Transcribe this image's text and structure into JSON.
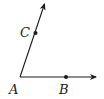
{
  "diagram": {
    "type": "geometry-angle",
    "colors": {
      "stroke": "#1a1a1a",
      "background": "#ffffff"
    },
    "vertex": {
      "label": "A",
      "x": 20,
      "y": 77
    },
    "rays": [
      {
        "id": "ray-AB",
        "from": "A",
        "through": "B",
        "end": {
          "x": 97,
          "y": 77
        }
      },
      {
        "id": "ray-AC",
        "from": "A",
        "through": "C",
        "end": {
          "x": 45,
          "y": 3
        }
      }
    ],
    "points": [
      {
        "label": "A",
        "x": 20,
        "y": 77,
        "label_x": 9,
        "label_y": 94
      },
      {
        "label": "B",
        "x": 66,
        "y": 77,
        "label_x": 59,
        "label_y": 94
      },
      {
        "label": "C",
        "x": 36,
        "y": 33,
        "label_x": 20,
        "label_y": 37
      }
    ]
  }
}
